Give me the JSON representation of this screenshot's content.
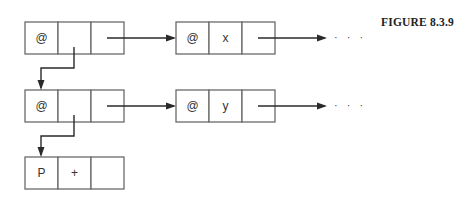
{
  "figure": {
    "caption": "FIGURE 8.3.9"
  },
  "nodes": [
    {
      "id": "n1",
      "x": 25,
      "y": 22,
      "cells": [
        "@",
        "",
        ""
      ]
    },
    {
      "id": "n2",
      "x": 176,
      "y": 22,
      "cells": [
        "@",
        "x",
        ""
      ]
    },
    {
      "id": "n3",
      "x": 25,
      "y": 90,
      "cells": [
        "@",
        "",
        ""
      ]
    },
    {
      "id": "n4",
      "x": 176,
      "y": 90,
      "cells": [
        "@",
        "y",
        ""
      ]
    },
    {
      "id": "n5",
      "x": 25,
      "y": 157,
      "cells": [
        "P",
        "+",
        ""
      ]
    }
  ],
  "cell": {
    "width": 33,
    "height": 32
  },
  "edges": [
    {
      "from": "n1",
      "to": "n2",
      "kind": "right",
      "points": [
        [
          107,
          38
        ],
        [
          174,
          38
        ]
      ]
    },
    {
      "from": "n2",
      "to": "...",
      "kind": "right",
      "points": [
        [
          258,
          38
        ],
        [
          325,
          38
        ]
      ]
    },
    {
      "from": "n1",
      "to": "n3",
      "kind": "down",
      "points": [
        [
          74,
          47
        ],
        [
          74,
          68
        ],
        [
          41,
          68
        ],
        [
          41,
          88
        ]
      ]
    },
    {
      "from": "n3",
      "to": "n4",
      "kind": "right",
      "points": [
        [
          107,
          106
        ],
        [
          174,
          106
        ]
      ]
    },
    {
      "from": "n4",
      "to": "...",
      "kind": "right",
      "points": [
        [
          258,
          106
        ],
        [
          325,
          106
        ]
      ]
    },
    {
      "from": "n3",
      "to": "n5",
      "kind": "down",
      "points": [
        [
          74,
          115
        ],
        [
          74,
          136
        ],
        [
          41,
          136
        ],
        [
          41,
          155
        ]
      ]
    }
  ],
  "ellipses": [
    {
      "x": 334,
      "y": 41,
      "text": "· · ·"
    },
    {
      "x": 334,
      "y": 109,
      "text": "· · ·"
    }
  ],
  "colors": {
    "box_stroke": "#6a6a6a",
    "arrow": "#2a2a2a",
    "background": "#ffffff"
  }
}
